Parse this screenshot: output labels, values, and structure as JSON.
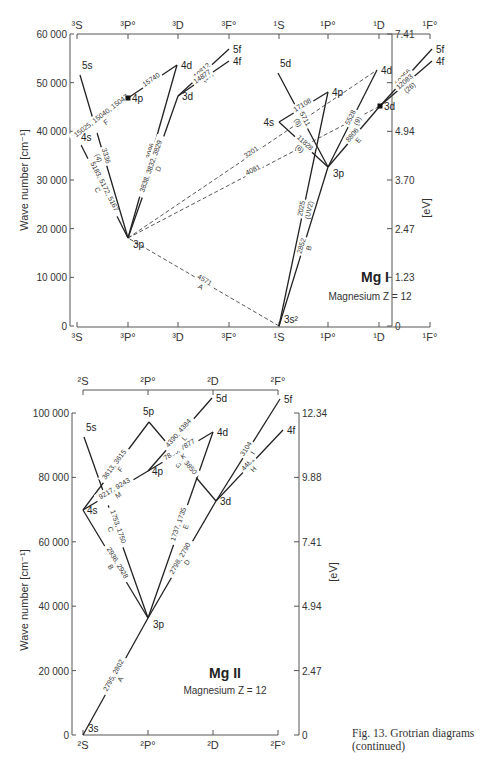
{
  "page_header": "Atomic Data Tables ... 183",
  "caption": {
    "line1": "Fig. 13.  Grotrian diagrams",
    "line2": "(continued)"
  },
  "chart_data": [
    {
      "type": "grotrian",
      "title": "Mg I",
      "subtitle": "Magnesium  Z = 12",
      "ylabel": "Wave number [cm⁻¹]",
      "ylabel_right": "[eV]",
      "ylim": [
        0,
        60000
      ],
      "yticks_left": [
        "0",
        "10 000",
        "20 000",
        "30 000",
        "40 000",
        "50 000",
        "60 000"
      ],
      "yticks_left_values": [
        0,
        10000,
        20000,
        30000,
        40000,
        50000,
        60000
      ],
      "yticks_right": [
        "0",
        "1.23",
        "2.47",
        "3.70",
        "4.94",
        "6.17",
        "7.41"
      ],
      "columns": [
        "³S",
        "³P°",
        "³D",
        "³F°",
        "¹S",
        "¹P°",
        "¹D",
        "¹F°"
      ],
      "levels": [
        {
          "name": "3s²",
          "column": "¹S",
          "energy": 0
        },
        {
          "name": "3p",
          "column": "³P°",
          "energy": 21870
        },
        {
          "name": "4s",
          "column": "³S",
          "energy": 41197
        },
        {
          "name": "5s",
          "column": "³S",
          "energy": 51872
        },
        {
          "name": "4p",
          "column": "³P°",
          "energy": 47850
        },
        {
          "name": "3d",
          "column": "³D",
          "energy": 47957
        },
        {
          "name": "4d",
          "column": "³D",
          "energy": 54192
        },
        {
          "name": "4f",
          "column": "³F°",
          "energy": 54676
        },
        {
          "name": "5f",
          "column": "³F°",
          "energy": 57204
        },
        {
          "name": "3p",
          "column": "¹P°",
          "energy": 35051
        },
        {
          "name": "4s",
          "column": "¹S",
          "energy": 43503
        },
        {
          "name": "5d",
          "column": "¹S",
          "energy": 53135
        },
        {
          "name": "4p",
          "column": "¹P°",
          "energy": 49347
        },
        {
          "name": "3d",
          "column": "¹D",
          "energy": 46403
        },
        {
          "name": "4d",
          "column": "¹D",
          "energy": 53135
        },
        {
          "name": "4f",
          "column": "¹F°",
          "energy": 54676
        },
        {
          "name": "5f",
          "column": "¹F°",
          "energy": 57204
        }
      ],
      "transitions": [
        {
          "from": "3s²",
          "to": "3p(³P°)",
          "label": "4571 / A",
          "style": "dashed"
        },
        {
          "from": "3p(³P°)",
          "to": "4d(¹D)",
          "label": "3201",
          "style": "dashed"
        },
        {
          "from": "3p(³P°)",
          "to": "3d(¹D)",
          "label": "4081",
          "style": "dashed"
        },
        {
          "from": "3p(³P°)",
          "to": "4s(³S)",
          "label": "5183, 5172, 5167 / C",
          "style": "solid"
        },
        {
          "from": "3p(³P°)",
          "to": "5s(³S)",
          "label": "3336 / (4)",
          "style": "solid"
        },
        {
          "from": "3p(³P°)",
          "to": "4d(³D)",
          "label": "3096 / (5)",
          "style": "solid"
        },
        {
          "from": "3p(³P°)",
          "to": "3d(³D)",
          "label": "3838, 3832, 3829 / D",
          "style": "solid"
        },
        {
          "from": "4s(³S)",
          "to": "4p(³P°)",
          "label": "15025, 15040, 15047 / F",
          "style": "solid"
        },
        {
          "from": "4p(³P°)",
          "to": "4d(³D)",
          "label": "15740",
          "style": "solid"
        },
        {
          "from": "3d(³D)",
          "to": "5f(³F°)",
          "label": "10812 / (37)",
          "style": "solid"
        },
        {
          "from": "3d(³D)",
          "to": "4f(³F°)",
          "label": "14877",
          "style": "solid"
        },
        {
          "from": "3s²",
          "to": "3p(¹P°)",
          "label": "2852 / B",
          "style": "solid"
        },
        {
          "from": "3s²",
          "to": "4p(¹P°)",
          "label": "2025 / (UV2)",
          "style": "solid"
        },
        {
          "from": "3p(¹P°)",
          "to": "4s(¹S)",
          "label": "11828 / (6)",
          "style": "solid"
        },
        {
          "from": "3p(¹P°)",
          "to": "5d(¹S)",
          "label": "5711 / (8)",
          "style": "solid"
        },
        {
          "from": "3p(¹P°)",
          "to": "4d(¹D)",
          "label": "5528 / (9)",
          "style": "solid"
        },
        {
          "from": "3p(¹P°)",
          "to": "3d(¹D)",
          "label": "8806 / E",
          "style": "solid"
        },
        {
          "from": "4s(¹S)",
          "to": "4p(¹P°)",
          "label": "17108",
          "style": "solid"
        },
        {
          "from": "3d(¹D)",
          "to": "5f(¹F°)",
          "label": "9256 / (27)",
          "style": "solid"
        },
        {
          "from": "3d(¹D)",
          "to": "4f(¹F°)",
          "label": "12083 / (26)",
          "style": "solid"
        }
      ]
    },
    {
      "type": "grotrian",
      "title": "Mg II",
      "subtitle": "Magnesium  Z = 12",
      "ylabel": "Wave number [cm⁻¹]",
      "ylabel_right": "[eV]",
      "ylim": [
        0,
        100000
      ],
      "yticks_left": [
        "0",
        "20 000",
        "40 000",
        "60 000",
        "80 000",
        "100 000"
      ],
      "yticks_left_values": [
        0,
        20000,
        40000,
        60000,
        80000,
        100000
      ],
      "yticks_right": [
        "0",
        "2.47",
        "4.94",
        "7.41",
        "9.88",
        "12.34"
      ],
      "columns": [
        "²S",
        "²P°",
        "²D",
        "²F°"
      ],
      "levels": [
        {
          "name": "3s",
          "column": "²S",
          "energy": 0
        },
        {
          "name": "3p",
          "column": "²P°",
          "energy": 35700
        },
        {
          "name": "4s",
          "column": "²S",
          "energy": 69805
        },
        {
          "name": "5s",
          "column": "²S",
          "energy": 92790
        },
        {
          "name": "4p",
          "column": "²P°",
          "energy": 80620
        },
        {
          "name": "5p",
          "column": "²P°",
          "energy": 97460
        },
        {
          "name": "3d",
          "column": "²D",
          "energy": 71490
        },
        {
          "name": "4d",
          "column": "²D",
          "energy": 93310
        },
        {
          "name": "5d",
          "column": "²D",
          "energy": 103420
        },
        {
          "name": "4f",
          "column": "²F°",
          "energy": 93800
        },
        {
          "name": "5f",
          "column": "²F°",
          "energy": 103700
        }
      ],
      "transitions": [
        {
          "from": "3s",
          "to": "3p",
          "label": "2795, 2802 / A"
        },
        {
          "from": "3p",
          "to": "4s",
          "label": "2936, 2928 / B"
        },
        {
          "from": "3p",
          "to": "5s",
          "label": "1753, 1750 / C"
        },
        {
          "from": "3p",
          "to": "3d",
          "label": "2798, 2790 / D"
        },
        {
          "from": "3p",
          "to": "4d",
          "label": "1737, 1735 / E"
        },
        {
          "from": "4s",
          "to": "5p",
          "label": "3613, 3615 / F"
        },
        {
          "from": "4s",
          "to": "4p",
          "label": "9217, 9243 / M"
        },
        {
          "from": "3d",
          "to": "5p",
          "label": "3848, 3850 / G"
        },
        {
          "from": "3d",
          "to": "4f",
          "label": "4481 / H"
        },
        {
          "from": "3d",
          "to": "5f",
          "label": "3104 / I"
        },
        {
          "from": "4p",
          "to": "4d",
          "label": "7896, 7877 / K"
        },
        {
          "from": "4p",
          "to": "5d",
          "label": "4390, 4384 / L"
        }
      ]
    }
  ]
}
